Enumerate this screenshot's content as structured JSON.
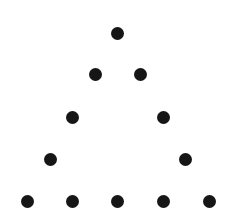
{
  "figure": {
    "background": "#ffffff",
    "dot_color": "#161616",
    "dot_diameter": 13,
    "dot_count": 12,
    "dots": [
      {
        "row": 1,
        "x": 117,
        "y": 33
      },
      {
        "row": 2,
        "x": 95,
        "y": 74
      },
      {
        "row": 2,
        "x": 140,
        "y": 74
      },
      {
        "row": 3,
        "x": 72,
        "y": 117
      },
      {
        "row": 3,
        "x": 163,
        "y": 117
      },
      {
        "row": 4,
        "x": 50,
        "y": 159
      },
      {
        "row": 4,
        "x": 185,
        "y": 159
      },
      {
        "row": 5,
        "x": 27,
        "y": 201
      },
      {
        "row": 5,
        "x": 72,
        "y": 201
      },
      {
        "row": 5,
        "x": 117,
        "y": 201
      },
      {
        "row": 5,
        "x": 163,
        "y": 201
      },
      {
        "row": 5,
        "x": 209,
        "y": 201
      }
    ]
  }
}
